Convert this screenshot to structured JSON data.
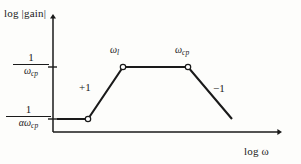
{
  "figure": {
    "caption_id": "asymptotic-gain-vs-frequency",
    "background_color": "#fdfdfb",
    "line_color": "#1a1a1a",
    "marker_fill": "#ffffff"
  },
  "axes": {
    "y_title": "log |gain|",
    "x_title": "log ω",
    "origin_x_px": 53,
    "baseline_y_px": 132,
    "y_top_px": 14,
    "x_right_px": 283
  },
  "y_ticks": [
    {
      "id": "upper",
      "numerator": "1",
      "denominator_base": "ω",
      "denominator_sub": "cp",
      "value_px": 67
    },
    {
      "id": "lower",
      "numerator": "1",
      "denominator_base": "αω",
      "denominator_sub": "cp",
      "value_px": 119
    }
  ],
  "annotations": {
    "corner_low": {
      "base": "ω",
      "sub": "l"
    },
    "corner_high": {
      "base": "ω",
      "sub": "cp"
    },
    "slope_rising": "+1",
    "slope_falling": "−1"
  },
  "chart_data": {
    "type": "line",
    "title": "",
    "subtitle": "",
    "xlabel": "log ω",
    "ylabel": "log |gain|",
    "grid": false,
    "legend": null,
    "axis_style": "arrow",
    "log_log": true,
    "series": [
      {
        "name": "asymptotic gain magnitude",
        "stroke": "#1a1a1a",
        "stroke_width": 2.1,
        "points_px": [
          {
            "x": 57,
            "y": 119,
            "marker": false
          },
          {
            "x": 88,
            "y": 119,
            "marker": true
          },
          {
            "x": 123,
            "y": 67,
            "marker": true
          },
          {
            "x": 188,
            "y": 67,
            "marker": true
          },
          {
            "x": 232,
            "y": 119,
            "marker": false
          }
        ],
        "segments": [
          {
            "from": 0,
            "to": 1,
            "slope": 0,
            "label": ""
          },
          {
            "from": 1,
            "to": 2,
            "slope": 1,
            "label": "+1"
          },
          {
            "from": 2,
            "to": 3,
            "slope": 0,
            "label": ""
          },
          {
            "from": 3,
            "to": 4,
            "slope": -1,
            "label": "−1"
          }
        ]
      }
    ],
    "breakpoints": [
      {
        "x_label": "",
        "y_label": "1/(αω_cp)",
        "x_px": 88,
        "y_px": 119
      },
      {
        "x_label": "ω_l",
        "y_label": "1/ω_cp",
        "x_px": 123,
        "y_px": 67
      },
      {
        "x_label": "ω_cp",
        "y_label": "1/ω_cp",
        "x_px": 188,
        "y_px": 67
      }
    ],
    "ytick_labels": [
      "1/(αω_cp)",
      "1/ω_cp"
    ],
    "ytick_px": [
      119,
      67
    ],
    "xtick_labels": []
  }
}
